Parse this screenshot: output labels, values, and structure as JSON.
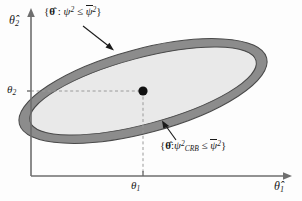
{
  "figure": {
    "background": "#fdfdfd"
  },
  "axes": {
    "y_axis_label": "θ̂",
    "y_axis_sub": "2",
    "x_axis_label": "θ̂",
    "x_axis_sub": "1",
    "y_tick_label": "θ",
    "y_tick_sub": "2",
    "x_tick_label": "θ",
    "x_tick_sub": "1",
    "axis_color": "#6e6e6e"
  },
  "labels": {
    "outer_set": {
      "open_brace": "{",
      "theta": "θ̂",
      "colon": " : ",
      "psi": "ψ",
      "psi_exp": "2",
      "leq": " ≤ ",
      "psi_bar": "ψ",
      "psi_bar_exp": "2",
      "close_brace": "}",
      "plain": "{θ̂ : ψ² ≤ ψ̄²}"
    },
    "inner_set": {
      "open_brace": "{",
      "theta": "θ̂",
      "colon": ":",
      "psi": "ψ",
      "psi_exp": "2",
      "psi_sub": "CRB",
      "leq": " ≤ ",
      "psi_bar": "ψ",
      "psi_bar_exp": "2",
      "close_brace": "}",
      "plain": "{θ̂:ψ²_CRB ≤ ψ̄²}"
    }
  },
  "shapes": {
    "outer_ellipse": {
      "name": "outer-confidence-ellipse",
      "fill": "#8c8c8c",
      "stroke": "#4a4a4a",
      "cx": 143,
      "cy": 91,
      "rx": 128,
      "ry": 42,
      "rotation_deg": -15
    },
    "inner_ellipse": {
      "name": "inner-crb-ellipse",
      "fill": "#e9e9e9",
      "stroke": "#4a4a4a",
      "cx": 143,
      "cy": 91,
      "rx": 117,
      "ry": 33,
      "rotation_deg": -15
    },
    "center_point": {
      "name": "true-parameter-point",
      "cx": 143,
      "cy": 91,
      "r": 4.6,
      "fill": "#111111"
    },
    "guide_lines": {
      "color": "#9a9a9a",
      "dash": "3,2.6"
    }
  },
  "annotations": {
    "outer_arrow": {
      "x1": 83,
      "y1": 26,
      "x2": 113,
      "y2": 50
    },
    "inner_arrow": {
      "x1": 176,
      "y1": 140,
      "x2": 162,
      "y2": 121
    },
    "arrow_color": "#1a1a1a"
  }
}
